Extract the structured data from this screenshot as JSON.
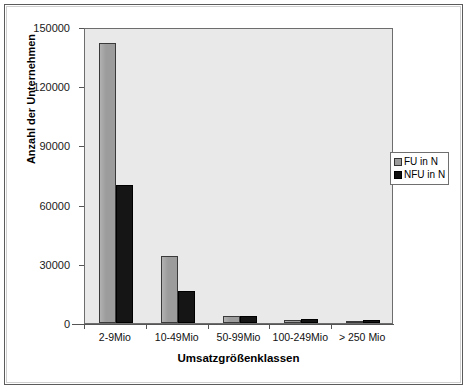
{
  "chart_data": {
    "type": "bar",
    "title": "",
    "xlabel": "Umsatzgrößenklassen",
    "ylabel": "Anzahl der Unternehmen",
    "categories": [
      "2-9Mio",
      "10-49Mio",
      "50-99Mio",
      "100-249Mio",
      "> 250 Mio"
    ],
    "series": [
      {
        "name": "FU in N",
        "color": "#9c9c9c",
        "values": [
          142000,
          34000,
          3700,
          1600,
          700
        ]
      },
      {
        "name": "NFU in N",
        "color": "#151515",
        "values": [
          70000,
          16000,
          3600,
          2100,
          1700
        ]
      }
    ],
    "ylim": [
      0,
      150000
    ],
    "yticks": [
      0,
      30000,
      60000,
      90000,
      120000,
      150000
    ],
    "ytick_labels": [
      "0",
      "30000",
      "60000",
      "90000",
      "120000",
      "150000"
    ],
    "grid": false,
    "legend_position": "right-middle",
    "plot_background": "#e9e9e9",
    "figure_background": "#ffffff"
  },
  "legend": {
    "entries": [
      {
        "label": "FU in N"
      },
      {
        "label": "NFU in N"
      }
    ]
  }
}
